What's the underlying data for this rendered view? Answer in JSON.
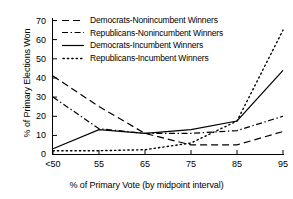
{
  "chart_data": {
    "type": "line",
    "title": "",
    "xlabel": "% of Primary Vote (by midpoint interval)",
    "ylabel": "% of Primary Elections Won",
    "categories": [
      "<50",
      "55",
      "65",
      "75",
      "85",
      "95"
    ],
    "xtick_labels": [
      "<50",
      "55",
      "65",
      "75",
      "85",
      "95"
    ],
    "ytick_labels": [
      "0",
      "10",
      "20",
      "30",
      "40",
      "50",
      "60",
      "70"
    ],
    "ylim": [
      0,
      70
    ],
    "ytick_step": 10,
    "grid": false,
    "legend_position": "top-left-inside",
    "series": [
      {
        "name": "Democrats-Nonincumbent Winners",
        "style": "dashed",
        "color": "#000000",
        "values": [
          41,
          25,
          11,
          5,
          5,
          12
        ]
      },
      {
        "name": "Republicans-Nonincumbent Winners",
        "style": "dash-dot",
        "color": "#000000",
        "values": [
          30,
          13.5,
          11,
          11,
          12.5,
          20
        ]
      },
      {
        "name": "Democrats-Incumbent Winners",
        "style": "solid",
        "color": "#000000",
        "values": [
          3,
          13,
          11,
          13,
          17.5,
          44
        ]
      },
      {
        "name": "Republicans-Incumbent Winners",
        "style": "dotted",
        "color": "#000000",
        "values": [
          2,
          2,
          2.5,
          6,
          17.5,
          65
        ]
      }
    ]
  },
  "axes": {
    "y_title": "% of Primary Elections Won",
    "x_title": "% of Primary Vote (by midpoint interval)"
  },
  "legend": {
    "items": [
      {
        "label": "Democrats-Nonincumbent Winners",
        "style": "dashed"
      },
      {
        "label": "Republicans-Nonincumbent Winners",
        "style": "dash-dot"
      },
      {
        "label": "Democrats-Incumbent Winners",
        "style": "solid"
      },
      {
        "label": "Republicans-Incumbent Winners",
        "style": "dotted"
      }
    ]
  }
}
